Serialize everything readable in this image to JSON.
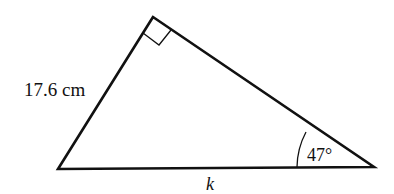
{
  "diagram": {
    "type": "right-triangle",
    "vertices": {
      "top": [
        153,
        17
      ],
      "left": [
        58,
        169
      ],
      "right": [
        374,
        167
      ]
    },
    "right_angle_at": "top",
    "labels": {
      "side_left": "17.6 cm",
      "angle_right": "47°",
      "base": "k"
    },
    "colors": {
      "stroke": "#111111",
      "background": "#ffffff"
    }
  }
}
